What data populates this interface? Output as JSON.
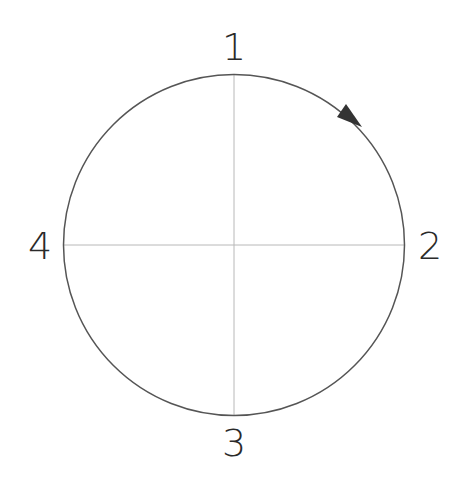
{
  "diagram": {
    "type": "clock-direction-circle",
    "labels": {
      "top": "1",
      "right": "2",
      "bottom": "3",
      "left": "4"
    },
    "arrow_direction": "clockwise",
    "colors": {
      "circle": "#555555",
      "axes": "#b8b8b8",
      "arrow": "#333333",
      "text": "#2a2a2a"
    }
  }
}
